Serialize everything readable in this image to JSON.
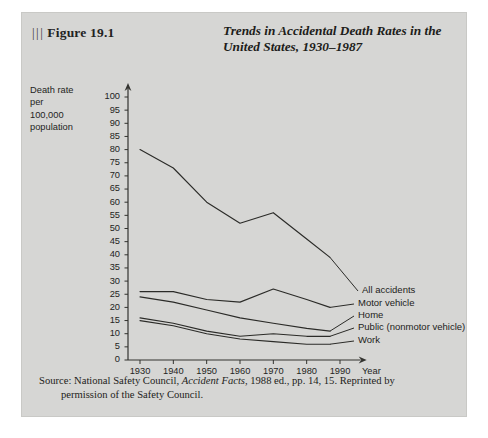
{
  "figure": {
    "marker_bars": "|||",
    "label": "Figure 19.1",
    "title_line1": "Trends in Accidental Death Rates in the",
    "title_line2": "United States, 1930–1987"
  },
  "axis_caption": {
    "line1": "Death rate",
    "line2": "per",
    "line3": "100,000",
    "line4": "population"
  },
  "source": {
    "lead": "Source:",
    "text_before_italic": " National Safety Council, ",
    "italic_title": "Accident Facts",
    "text_after_italic": ", 1988 ed., pp. 14, 15. Reprinted by",
    "line2": "permission of the Safety Council."
  },
  "colors": {
    "panel_background": "#d6d6d4",
    "page_background": "#ffffff",
    "line": "#2b2b28",
    "text": "#1d1d1a",
    "axis": "#33332f"
  },
  "chart_data": {
    "type": "line",
    "title": "Trends in Accidental Death Rates in the United States, 1930–1987",
    "xlabel": "Year",
    "ylabel": "Death rate per 100,000 population",
    "xlim": [
      1925,
      1995
    ],
    "ylim": [
      0,
      100
    ],
    "grid": false,
    "legend": "series labels at right end of each line",
    "x_ticks": [
      1930,
      1940,
      1950,
      1960,
      1970,
      1980,
      1990
    ],
    "y_ticks": [
      0,
      5,
      10,
      15,
      20,
      25,
      30,
      35,
      40,
      45,
      50,
      55,
      60,
      65,
      70,
      75,
      80,
      85,
      90,
      95,
      100
    ],
    "x": [
      1930,
      1940,
      1950,
      1960,
      1970,
      1980,
      1987
    ],
    "series": [
      {
        "name": "All accidents",
        "values": [
          80,
          73,
          60,
          52,
          56,
          46,
          39
        ]
      },
      {
        "name": "Motor vehicle",
        "values": [
          26,
          26,
          23,
          22,
          27,
          23,
          20
        ]
      },
      {
        "name": "Home",
        "values": [
          24,
          22,
          19,
          16,
          14,
          12,
          11
        ]
      },
      {
        "name": "Public (nonmotor vehicle)",
        "values": [
          16,
          14,
          11,
          9,
          10,
          9,
          9
        ]
      },
      {
        "name": "Work",
        "values": [
          15,
          13,
          10,
          8,
          7,
          6,
          6
        ]
      }
    ]
  }
}
